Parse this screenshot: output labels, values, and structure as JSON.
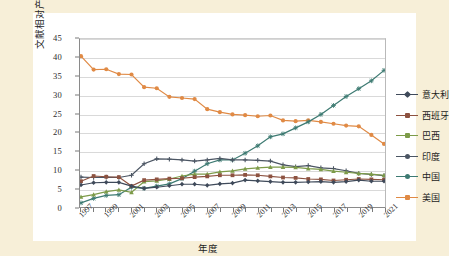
{
  "chart": {
    "title": "",
    "xlabel": "年度",
    "ylabel": "文献相对产出率（%）",
    "ylabel_unit": "%",
    "grid": true,
    "legend_position": "right"
  },
  "axis": {
    "y_ticks": [
      "0",
      "5",
      "10",
      "15",
      "20",
      "25",
      "30",
      "35",
      "40",
      "45"
    ],
    "x_ticks": [
      "1997",
      "1999",
      "2001",
      "2003",
      "2005",
      "2007",
      "2009",
      "2011",
      "2013",
      "2015",
      "2017",
      "2019",
      "2021"
    ]
  },
  "colors": {
    "background": "#f7efd8",
    "card": "#ffffff",
    "grid": "#d9d9d9",
    "italy": "#3f4a5a",
    "spain": "#8d5240",
    "brazil": "#7d9b49",
    "india": "#4b5563",
    "china": "#3d7a72",
    "usa": "#e08a45"
  },
  "legend": [
    {
      "label": "意大利",
      "color": "#3f4a5a",
      "marker": "diamond"
    },
    {
      "label": "西班牙",
      "color": "#8d5240",
      "marker": "square"
    },
    {
      "label": "巴西",
      "color": "#7d9b49",
      "marker": "triangle"
    },
    {
      "label": "印度",
      "color": "#4b5563",
      "marker": "cross"
    },
    {
      "label": "中国",
      "color": "#3d7a72",
      "marker": "star"
    },
    {
      "label": "美国",
      "color": "#e08a45",
      "marker": "circle"
    }
  ],
  "chart_data": {
    "type": "line",
    "title": "",
    "xlabel": "年度",
    "ylabel": "文献相对产出率（%）",
    "xlim": [
      1997,
      2021
    ],
    "ylim": [
      0,
      45
    ],
    "grid": true,
    "legend_position": "right",
    "x": [
      1997,
      1998,
      1999,
      2000,
      2001,
      2002,
      2003,
      2004,
      2005,
      2006,
      2007,
      2008,
      2009,
      2010,
      2011,
      2012,
      2013,
      2014,
      2015,
      2016,
      2017,
      2018,
      2019,
      2020,
      2021
    ],
    "series": [
      {
        "name": "美国",
        "color": "#e08a45",
        "values": [
          40.4,
          36.8,
          36.9,
          35.6,
          35.5,
          32.1,
          31.8,
          29.5,
          29.2,
          28.9,
          26.2,
          25.4,
          24.8,
          24.6,
          24.3,
          24.5,
          23.2,
          23.0,
          23.2,
          22.8,
          22.3,
          21.8,
          21.6,
          19.3,
          16.9
        ]
      },
      {
        "name": "中国",
        "color": "#3d7a72",
        "values": [
          1.1,
          2.3,
          3.1,
          3.3,
          5.3,
          5.0,
          5.6,
          6.2,
          7.6,
          9.6,
          11.6,
          12.6,
          12.6,
          14.4,
          16.4,
          18.8,
          19.6,
          21.2,
          22.8,
          24.8,
          27.2,
          29.6,
          31.7,
          33.8,
          36.6
        ]
      },
      {
        "name": "印度",
        "color": "#4b5563",
        "values": [
          8.0,
          7.9,
          8.0,
          7.9,
          8.5,
          11.6,
          12.9,
          12.8,
          12.6,
          12.3,
          12.6,
          13.0,
          12.6,
          12.6,
          12.5,
          12.3,
          11.3,
          10.8,
          11.1,
          10.5,
          10.3,
          9.7,
          9.0,
          8.7,
          8.4
        ]
      },
      {
        "name": "巴西",
        "color": "#7d9b49",
        "values": [
          2.7,
          3.3,
          4.1,
          4.6,
          3.9,
          6.8,
          7.0,
          7.5,
          8.3,
          8.8,
          8.8,
          9.4,
          9.7,
          10.2,
          10.5,
          10.7,
          10.7,
          10.6,
          10.3,
          10.1,
          9.6,
          9.3,
          9.0,
          8.8,
          8.5
        ]
      },
      {
        "name": "西班牙",
        "color": "#8d5240",
        "values": [
          6.9,
          8.3,
          8.1,
          8.0,
          5.6,
          7.2,
          7.4,
          7.6,
          7.7,
          8.0,
          8.2,
          8.5,
          8.5,
          8.6,
          8.5,
          8.2,
          7.9,
          7.8,
          7.5,
          7.4,
          7.1,
          7.3,
          7.5,
          7.4,
          7.3
        ]
      },
      {
        "name": "意大利",
        "color": "#3f4a5a",
        "values": [
          5.9,
          6.5,
          6.6,
          6.6,
          5.6,
          5.0,
          5.3,
          5.7,
          6.1,
          6.1,
          5.8,
          6.2,
          6.4,
          7.2,
          7.0,
          6.8,
          6.6,
          6.6,
          6.7,
          6.8,
          6.6,
          6.8,
          7.2,
          6.9,
          6.9
        ]
      }
    ]
  }
}
